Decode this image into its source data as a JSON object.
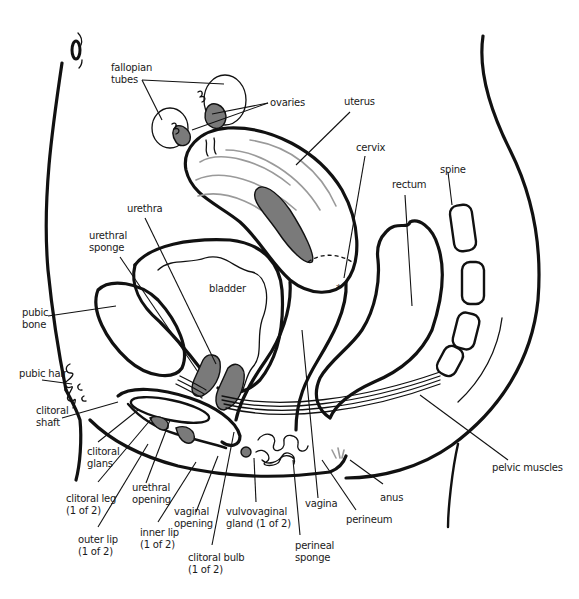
{
  "diagram": {
    "type": "anatomical-illustration",
    "colors": {
      "line": "#111111",
      "shade": "#7a7a7a",
      "light_shade": "#9a9a9a",
      "background": "#ffffff"
    },
    "labels": {
      "fallopian_tubes": "fallopian\ntubes",
      "ovaries": "ovaries",
      "uterus": "uterus",
      "cervix": "cervix",
      "spine": "spine",
      "rectum": "rectum",
      "urethra": "urethra",
      "urethral_sponge": "urethral\nsponge",
      "bladder": "bladder",
      "pubic_bone": "pubic\nbone",
      "pubic_hair": "pubic hair",
      "clitoral_shaft": "clitoral\nshaft",
      "clitoral_glans": "clitoral\nglans",
      "clitoral_leg": "clitoral leg\n(1 of 2)",
      "urethral_opening": "urethral\nopening",
      "outer_lip": "outer lip\n(1 of 2)",
      "vaginal_opening": "vaginal\nopening",
      "inner_lip": "inner lip\n(1 of 2)",
      "vulvovaginal_gland": "vulvovaginal\ngland (1 of 2)",
      "clitoral_bulb": "clitoral bulb\n(1 of 2)",
      "perineal_sponge": "perineal\nsponge",
      "vagina": "vagina",
      "perineum": "perineum",
      "anus": "anus",
      "pelvic_muscles": "pelvic muscles"
    }
  }
}
